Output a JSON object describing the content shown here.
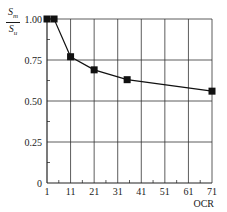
{
  "chart_data": {
    "type": "line",
    "title": "",
    "xlabel": "OCR",
    "ylabel": "S_m / S_u",
    "ylabel_num": "S",
    "ylabel_num_sub": "m",
    "ylabel_den": "S",
    "ylabel_den_sub": "u",
    "x": [
      1,
      4,
      11,
      21,
      35,
      71
    ],
    "series": [
      {
        "name": "S_m/S_u",
        "values": [
          1.0,
          1.0,
          0.77,
          0.69,
          0.63,
          0.56
        ],
        "marker": "square"
      }
    ],
    "xticks": [
      "1",
      "11",
      "21",
      "31",
      "41",
      "51",
      "61",
      "71"
    ],
    "yticks": [
      "0",
      "0.25",
      "0.50",
      "0.75",
      "1.00"
    ],
    "xlim": [
      1,
      71
    ],
    "ylim": [
      0,
      1.0
    ],
    "grid": true,
    "legend": null
  }
}
